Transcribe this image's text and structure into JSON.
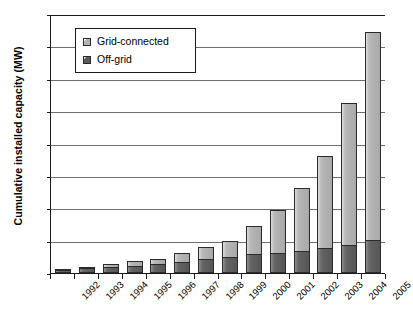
{
  "chart_data": {
    "type": "bar",
    "stacked": true,
    "title": "",
    "subtitle": "",
    "xlabel": "",
    "ylabel": "Cumulative installed capacity (MW)",
    "ylim": [
      0,
      4000
    ],
    "ytick_step": 500,
    "ytick_labels": [
      "4000",
      "3500",
      "3000",
      "2500",
      "2000",
      "1500",
      "1000",
      "500",
      "0"
    ],
    "ytick_values": [
      4000,
      3500,
      3000,
      2500,
      2000,
      1500,
      1000,
      500,
      0
    ],
    "grid": true,
    "grid_axis": "y",
    "legend_position": "top-left-inside",
    "categories": [
      "1992",
      "1993",
      "1994",
      "1995",
      "1996",
      "1997",
      "1998",
      "1999",
      "2000",
      "2001",
      "2002",
      "2003",
      "2004",
      "2005"
    ],
    "series": [
      {
        "name": "Off-grid",
        "color": "#606060",
        "values": [
          50,
          75,
          95,
          115,
          140,
          175,
          210,
          250,
          290,
          310,
          340,
          390,
          440,
          510
        ]
      },
      {
        "name": "Grid-connected",
        "color": "#b3b3b3",
        "values": [
          10,
          25,
          50,
          65,
          80,
          130,
          190,
          250,
          430,
          670,
          980,
          1410,
          2180,
          3210
        ]
      }
    ],
    "totals": [
      60,
      100,
      145,
      180,
      220,
      305,
      400,
      500,
      720,
      980,
      1320,
      1800,
      2620,
      3720
    ],
    "annotations": []
  },
  "legend": {
    "items": [
      {
        "label": "Grid-connected",
        "swatch": "light-gray-square"
      },
      {
        "label": "Off-grid",
        "swatch": "dark-gray-square"
      }
    ]
  }
}
